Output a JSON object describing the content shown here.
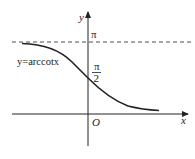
{
  "diagram": {
    "function_label": "y=arccotx",
    "axes": {
      "x_label": "x",
      "y_label": "y",
      "origin_label": "O"
    },
    "asymptote_label": "π",
    "intercept_label": {
      "numerator": "π",
      "denominator": "2"
    },
    "colors": {
      "stroke": "#222222",
      "background": "#ffffff"
    }
  }
}
